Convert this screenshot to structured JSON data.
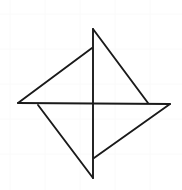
{
  "figure": {
    "name": "pinwheel-four-point-star",
    "width": 182,
    "height": 190,
    "background_color": "#ffffff",
    "grid": {
      "visible": true,
      "color": "#fafafa",
      "line_width": 1,
      "vertical_x": [
        10,
        45,
        80,
        115,
        150
      ],
      "horizontal_y": [
        14,
        49,
        84,
        119,
        154
      ]
    },
    "stroke_color": "#1a1a1a",
    "stroke_width": 1.9,
    "points": {
      "top": [
        93,
        29
      ],
      "right": [
        170,
        104
      ],
      "bottom": [
        93,
        178
      ],
      "left": [
        18,
        103
      ],
      "center": [
        93,
        103
      ],
      "inner_top": [
        92,
        48
      ],
      "inner_right": [
        148,
        103
      ],
      "inner_bottom": [
        94,
        158
      ],
      "inner_left": [
        38,
        105
      ]
    },
    "segments": [
      {
        "name": "vertical-axis",
        "from": [
          93,
          29
        ],
        "to": [
          93,
          178
        ]
      },
      {
        "name": "horizontal-axis",
        "from": [
          18,
          103
        ],
        "to": [
          170,
          104
        ]
      },
      {
        "name": "diagonal-top-to-right",
        "from": [
          93,
          29
        ],
        "to": [
          148,
          103
        ]
      },
      {
        "name": "diagonal-left-to-inner-top",
        "from": [
          18,
          103
        ],
        "to": [
          92,
          48
        ]
      },
      {
        "name": "diagonal-inner-left-to-bottom",
        "from": [
          38,
          105
        ],
        "to": [
          93,
          178
        ]
      },
      {
        "name": "diagonal-right-to-inner-bottom",
        "from": [
          170,
          104
        ],
        "to": [
          94,
          158
        ]
      }
    ]
  },
  "chart_data": {
    "type": "scatter",
    "title": "",
    "xlabel": "",
    "ylabel": "",
    "point_labels": [
      "top",
      "right",
      "bottom",
      "left",
      "center"
    ],
    "x": [
      93,
      170,
      93,
      18,
      93
    ],
    "y": [
      29,
      104,
      178,
      103,
      103
    ],
    "xlim": [
      0,
      182
    ],
    "ylim": [
      0,
      190
    ],
    "grid": true,
    "legend": "none"
  }
}
